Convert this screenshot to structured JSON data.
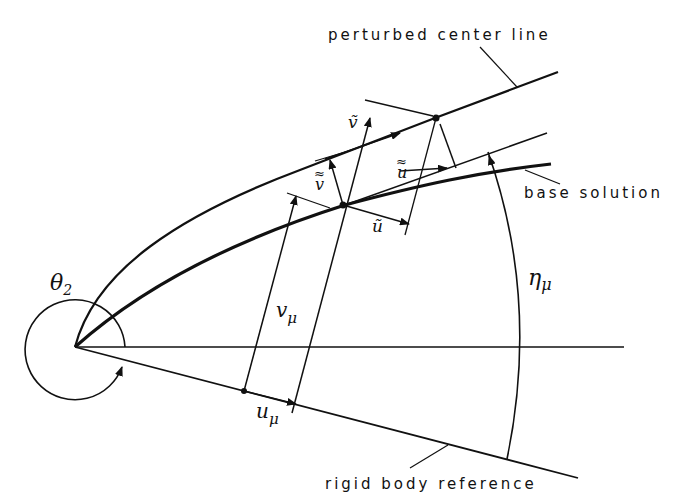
{
  "diagram": {
    "type": "geometric-kinematics-diagram",
    "labels": {
      "perturbed_center_line": "perturbed center line",
      "base_solution": "base solution",
      "rigid_body_reference": "rigid body reference",
      "theta": "θ",
      "theta_sub": "2",
      "v_mu": "v",
      "u_mu": "u",
      "mu": "μ",
      "eta": "η",
      "v_tilde": "ṽ",
      "u_tilde": "ũ",
      "v_dtilde": "v",
      "u_dtilde": "u",
      "dtilde": "≈",
      "tilde": "~"
    },
    "colors": {
      "ink": "#111111",
      "background": "#ffffff"
    }
  }
}
